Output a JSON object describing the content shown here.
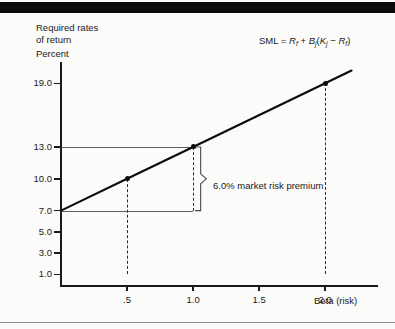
{
  "figure": {
    "background_color": "#fbfbfa",
    "ink_color": "#1a1a1a",
    "top_bar_color": "#0a0a0a"
  },
  "labels": {
    "y_axis_title": "Required rates",
    "y_axis_title_line2": "of return",
    "y_axis_unit": "Percent",
    "x_axis_title": "Beta (risk)",
    "formula_prefix": "SML = ",
    "formula_rf": "R",
    "formula_rf_sub": "f",
    "formula_plus": " + ",
    "formula_b": "B",
    "formula_b_sub": "j",
    "formula_open": "(",
    "formula_k": "K",
    "formula_k_sub": "j",
    "formula_minus": " − ",
    "formula_rf2": "R",
    "formula_rf2_sub": "f",
    "formula_close": ")",
    "annotation": "6.0% market risk premium"
  },
  "chart_data": {
    "type": "line",
    "title": "",
    "subtitle": "",
    "xlabel": "Beta (risk)",
    "ylabel": "Required rates of return (Percent)",
    "xlim": [
      0.0,
      2.4
    ],
    "ylim": [
      0.0,
      21.0
    ],
    "grid": false,
    "legend": "none",
    "annotations": [
      {
        "text": "SML = Rf + Bj(Kj − Rf)",
        "x": 1.75,
        "y": 20.6
      },
      {
        "text": "6.0% market risk premium",
        "x": 1.22,
        "y": 10.6
      }
    ],
    "x_ticks": [
      0.5,
      1.0,
      1.5,
      2.0
    ],
    "x_tick_labels": [
      ".5",
      "1.0",
      "1.5",
      "2.0"
    ],
    "y_ticks": [
      1.0,
      3.0,
      5.0,
      7.0,
      10.0,
      13.0,
      19.0
    ],
    "y_tick_labels": [
      "1.0",
      "3.0",
      "5.0",
      "7.0",
      "10.0",
      "13.0",
      "19.0"
    ],
    "series": [
      {
        "name": "SML",
        "type": "line",
        "risk_free_rate": 7.0,
        "market_risk_premium": 6.0,
        "x": [
          0.0,
          0.5,
          1.0,
          2.0,
          2.2
        ],
        "values": [
          7.0,
          10.0,
          13.0,
          19.0,
          20.2
        ],
        "markers": [
          {
            "x": 0.5,
            "y": 10.0
          },
          {
            "x": 1.0,
            "y": 13.0
          },
          {
            "x": 2.0,
            "y": 19.0
          }
        ]
      }
    ],
    "guides": {
      "horizontal": [
        {
          "y": 13.0,
          "x_from": 0.0,
          "x_to": 1.0
        },
        {
          "y": 7.0,
          "x_from": 0.0,
          "x_to": 1.0
        }
      ],
      "droplines": [
        {
          "x": 0.5,
          "y_from": 1.0,
          "y_to": 10.0
        },
        {
          "x": 1.0,
          "y_from": 7.0,
          "y_to": 13.0
        },
        {
          "x": 2.0,
          "y_from": 1.0,
          "y_to": 19.0
        }
      ],
      "brace": {
        "x": 1.0,
        "y_top": 13.0,
        "y_bottom": 7.0,
        "span": 6.0
      }
    }
  }
}
